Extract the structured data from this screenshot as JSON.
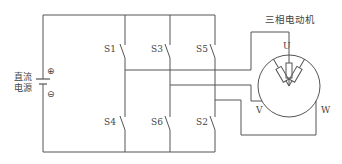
{
  "diagram": {
    "type": "circuit",
    "title": "三相电动机",
    "source": {
      "label_line1": "直流",
      "label_line2": "电源",
      "positive": "⊕",
      "negative": "⊖"
    },
    "switches": {
      "top": [
        "S1",
        "S3",
        "S5"
      ],
      "bottom": [
        "S4",
        "S6",
        "S2"
      ]
    },
    "motor": {
      "label": "三相电动机",
      "terminals": [
        "U",
        "V",
        "W"
      ]
    },
    "colors": {
      "line": "#555555",
      "text": "#444444",
      "background": "#ffffff"
    }
  }
}
